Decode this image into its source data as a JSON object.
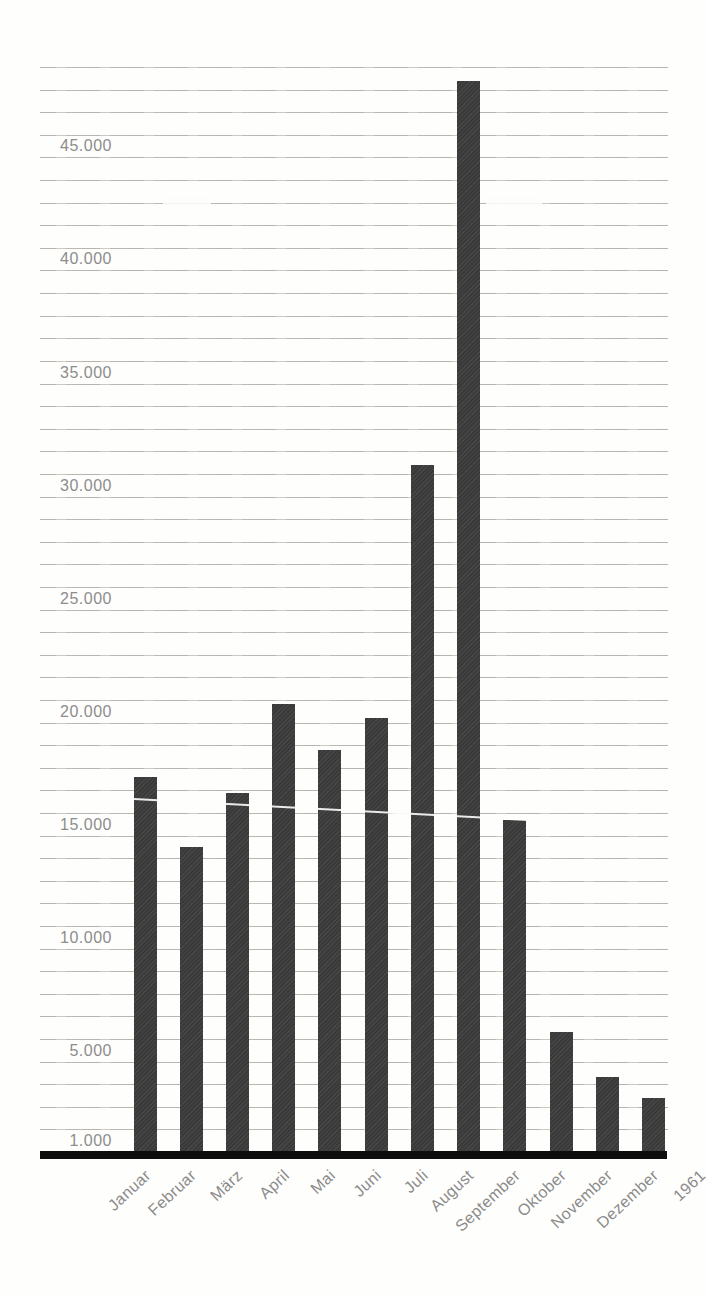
{
  "chart_data": {
    "type": "bar",
    "title": "",
    "categories": [
      "Januar",
      "Februar",
      "März",
      "April",
      "Mai",
      "Juni",
      "Juli",
      "August",
      "September",
      "Oktober",
      "November",
      "Dezember"
    ],
    "values": [
      17600,
      14500,
      16900,
      20800,
      18800,
      20200,
      31400,
      48400,
      15700,
      6300,
      4300,
      3400
    ],
    "x_axis_trailing_label": "1961",
    "y_tick_values": [
      1000,
      5000,
      10000,
      15000,
      20000,
      25000,
      30000,
      35000,
      40000,
      45000
    ],
    "y_tick_labels": [
      "1.000",
      "5.000",
      "10.000",
      "15.000",
      "20.000",
      "25.000",
      "30.000",
      "35.000",
      "40.000",
      "45.000"
    ],
    "ylim": [
      1000,
      49000
    ],
    "gridline_interval": 1000,
    "grid": true,
    "legend": false,
    "x_tick_rotation_deg": -43,
    "colors": {
      "bar": "#3c3c3d",
      "gridline": "#b8b4ae",
      "axis": "#0d0d0d",
      "labels": "#8c8c8b",
      "background": "#fefefd"
    }
  }
}
